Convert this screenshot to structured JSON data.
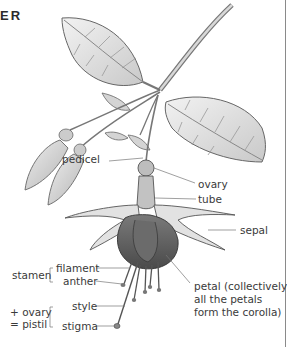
{
  "heading": "ER",
  "labels": {
    "pedicel": "pedicel",
    "ovary": "ovary",
    "tube": "tube",
    "sepal": "sepal",
    "filament": "filament",
    "anther": "anther",
    "stamen": "stamen",
    "style": "style",
    "stigma": "stigma",
    "pistil_line1": "+ ovary",
    "pistil_line2": "= pistil",
    "petal_line1": "petal (collectively,",
    "petal_line2": "all the petals",
    "petal_line3": "form the corolla)"
  }
}
